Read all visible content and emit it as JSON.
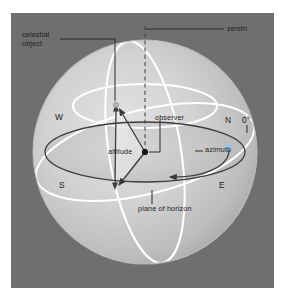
{
  "figure": {
    "panel_background": "#6f6f6f",
    "sphere_fill_light": "#d4d4d4",
    "sphere_fill_dark": "#9a9a9a",
    "grid_color": "#ffffff",
    "line_color": "#3a3a3a",
    "text_color": "#1b1b1b",
    "page_background": "#ffffff"
  },
  "labels": {
    "celestial_object": "celestial\nobject",
    "celestial_object_line1": "celestial",
    "celestial_object_line2": "object",
    "zenith": "zenith",
    "observer": "observer",
    "altitude": "altitude",
    "azimuth": "azimuth",
    "plane_of_horizon": "plane of horizon",
    "west": "W",
    "north": "N",
    "south": "S",
    "east": "E",
    "zero_degrees": "0°"
  },
  "diagram_data": {
    "type": "diagram",
    "subject": "horizontal (alt-azimuth) celestial coordinate system",
    "sphere": {
      "center_x": 145,
      "center_y": 152,
      "radius": 112
    },
    "horizon_plane": {
      "semi_major": 100,
      "semi_minor": 30,
      "center_x": 145,
      "center_y": 152
    },
    "upper_circle": {
      "semi_major": 72,
      "semi_minor": 22,
      "center_y": 106
    },
    "points": [
      {
        "name": "observer",
        "x": 145,
        "y": 152,
        "marker": "filled-dot"
      },
      {
        "name": "celestial-object",
        "x": 116,
        "y": 105,
        "marker": "small-dot"
      },
      {
        "name": "horizon-projection",
        "x": 115,
        "y": 188,
        "marker": "arrowhead"
      },
      {
        "name": "zenith",
        "x": 145,
        "y": 26,
        "marker": "axis-top"
      }
    ],
    "measured_angles": [
      {
        "name": "altitude",
        "from": "horizon-projection",
        "to": "celestial-object",
        "vertex": "observer"
      },
      {
        "name": "azimuth",
        "from": "north-point",
        "to": "horizon-projection",
        "vertex": "observer"
      }
    ],
    "cardinal_points": [
      {
        "label": "W",
        "x": 58,
        "y": 118
      },
      {
        "label": "N",
        "x": 228,
        "y": 121
      },
      {
        "label": "S",
        "x": 62,
        "y": 186
      },
      {
        "label": "E",
        "x": 222,
        "y": 186
      },
      {
        "label": "0°",
        "x": 245,
        "y": 121
      }
    ],
    "zenith_axis": {
      "style": "dashed",
      "from_y": 26,
      "to_y": 152,
      "x": 145
    }
  }
}
